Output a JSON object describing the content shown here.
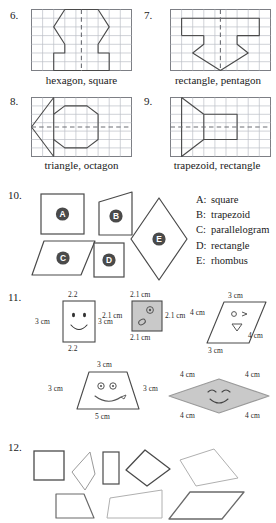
{
  "problems": {
    "p6": {
      "number": "6.",
      "caption": "hexagon, square",
      "symmetry": "vertical"
    },
    "p7": {
      "number": "7.",
      "caption": "rectangle, pentagon",
      "symmetry": "vertical"
    },
    "p8": {
      "number": "8.",
      "caption": "triangle, octagon",
      "symmetry": "horizontal"
    },
    "p9": {
      "number": "9.",
      "caption": "trapezoid, rectangle",
      "symmetry": "horizontal"
    },
    "p10": {
      "number": "10.",
      "shape_labels": {
        "a": "A",
        "b": "B",
        "c": "C",
        "d": "D",
        "e": "E"
      },
      "answers": [
        {
          "key": "A:",
          "name": "square"
        },
        {
          "key": "B:",
          "name": "trapezoid"
        },
        {
          "key": "C:",
          "name": "parallelogram"
        },
        {
          "key": "D:",
          "name": "rectangle"
        },
        {
          "key": "E:",
          "name": "rhombus"
        }
      ]
    },
    "p11": {
      "number": "11.",
      "rectangle": {
        "top": "2.2",
        "bottom": "2.2",
        "left": "3 cm",
        "right": "3 cm"
      },
      "square": {
        "top": "2.1 cm",
        "bottom": "2.1 cm",
        "left": "2.1 cm",
        "right": "2.1 cm"
      },
      "parallelogram": {
        "top": "3 cm",
        "bottom": "3 cm",
        "left": "4 cm",
        "right": "4 cm"
      },
      "trapezoid": {
        "top": "3 cm",
        "bottom": "5 cm",
        "left": "3 cm",
        "right": "3 cm"
      },
      "rhombus": {
        "top_left": "4 cm",
        "top_right": "4 cm",
        "bottom_left": "4 cm",
        "bottom_right": "4 cm"
      }
    },
    "p12": {
      "number": "12."
    }
  },
  "colors": {
    "ink": "#1a1a1a",
    "grid_line": "#b9bcc4",
    "shape_stroke": "#4a4a4a",
    "shape_fill_gray": "#c9c9c9",
    "badge_fill": "#4a4a4a",
    "badge_text": "#ffffff"
  }
}
